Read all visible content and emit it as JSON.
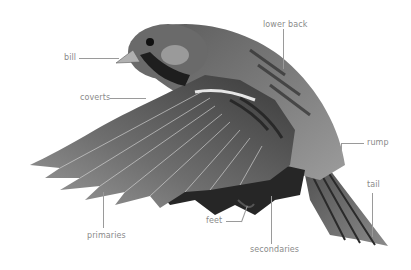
{
  "figure": {
    "background": "#ffffff",
    "label_color": "#8a8a8a",
    "line_color": "#9a9a9a"
  },
  "labels": {
    "bill": "bill",
    "lower_back": "lower back",
    "coverts": "coverts",
    "rump": "rump",
    "tail": "tail",
    "primaries": "primaries",
    "feet": "feet",
    "secondaries": "secondaries"
  }
}
